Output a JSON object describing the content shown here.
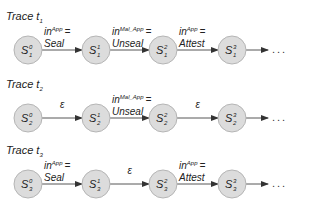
{
  "traces": [
    {
      "label": "Trace t",
      "sub": "1",
      "states": [
        {
          "name": "S",
          "sup": "0",
          "sub": "1"
        },
        {
          "name": "S",
          "sup": "1",
          "sub": "1"
        },
        {
          "name": "S",
          "sup": "2",
          "sub": "1"
        },
        {
          "name": "S",
          "sup": "3",
          "sub": "1"
        }
      ],
      "edges": [
        {
          "type": "input",
          "var": "in",
          "sup": "App",
          "eq": "=",
          "value": "Seal"
        },
        {
          "type": "input",
          "var": "in",
          "sup": "Mal_App",
          "eq": "=",
          "value": "Unseal"
        },
        {
          "type": "input",
          "var": "in",
          "sup": "App",
          "eq": "=",
          "value": "Attest"
        }
      ],
      "continuation": "..."
    },
    {
      "label": "Trace t",
      "sub": "2",
      "states": [
        {
          "name": "S",
          "sup": "0",
          "sub": "2"
        },
        {
          "name": "S",
          "sup": "1",
          "sub": "2"
        },
        {
          "name": "S",
          "sup": "2",
          "sub": "2"
        },
        {
          "name": "S",
          "sup": "3",
          "sub": "2"
        }
      ],
      "edges": [
        {
          "type": "epsilon",
          "value": "ε"
        },
        {
          "type": "input",
          "var": "in",
          "sup": "Mal_App",
          "eq": "=",
          "value": "Unseal"
        },
        {
          "type": "epsilon",
          "value": "ε"
        }
      ],
      "continuation": "..."
    },
    {
      "label": "Trace t",
      "sub": "3",
      "states": [
        {
          "name": "S",
          "sup": "0",
          "sub": "3"
        },
        {
          "name": "S",
          "sup": "1",
          "sub": "3"
        },
        {
          "name": "S",
          "sup": "2",
          "sub": "3"
        },
        {
          "name": "S",
          "sup": "3",
          "sub": "3"
        }
      ],
      "edges": [
        {
          "type": "input",
          "var": "in",
          "sup": "App",
          "eq": "=",
          "value": "Seal"
        },
        {
          "type": "epsilon",
          "value": "ε"
        },
        {
          "type": "input",
          "var": "in",
          "sup": "App",
          "eq": "=",
          "value": "Attest"
        }
      ],
      "continuation": "..."
    }
  ]
}
